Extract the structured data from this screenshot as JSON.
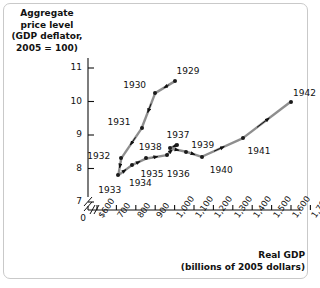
{
  "chart_data": {
    "type": "line",
    "title": "",
    "ylabel": "Aggregate\nprice level\n(GDP deflator,\n2005 = 100)",
    "ylabel_lines": [
      "Aggregate",
      "price level",
      "(GDP deflator,",
      "2005 = 100)"
    ],
    "xlabel_lines": [
      "Real GDP",
      "(billions of 2005 dollars)"
    ],
    "xlabel": "Real GDP (billions of 2005 dollars)",
    "yticks": [
      11,
      10,
      9,
      8,
      7
    ],
    "ytick_labels": [
      "11",
      "10",
      "9",
      "8",
      "7"
    ],
    "ylim": [
      7,
      11.4
    ],
    "y_axis_break": true,
    "xticks": [
      600,
      700,
      800,
      900,
      1000,
      1100,
      1200,
      1300,
      1400,
      1500,
      1600,
      1700,
      1800
    ],
    "xtick_labels": [
      "$600",
      "700",
      "800",
      "900",
      "1,000",
      "1,100",
      "1,200",
      "1,300",
      "1,400",
      "1,500",
      "1,600",
      "1,700",
      "1,800"
    ],
    "x_origin_label": "0",
    "xlim": [
      600,
      1800
    ],
    "x_axis_break": true,
    "grid": false,
    "legend": null,
    "series": [
      {
        "name": "U.S. economy 1929-1942",
        "points": [
          {
            "label": "1929",
            "x": 1000,
            "y": 10.6
          },
          {
            "label": "1930",
            "x": 900,
            "y": 10.25
          },
          {
            "label": "1931",
            "x": 830,
            "y": 9.2
          },
          {
            "label": "1932",
            "x": 725,
            "y": 8.3
          },
          {
            "label": "1933",
            "x": 710,
            "y": 7.8
          },
          {
            "label": "1934",
            "x": 780,
            "y": 8.1
          },
          {
            "label": "1935",
            "x": 855,
            "y": 8.3
          },
          {
            "label": "1936",
            "x": 960,
            "y": 8.4
          },
          {
            "label": "1937",
            "x": 1010,
            "y": 8.7
          },
          {
            "label": "1938",
            "x": 975,
            "y": 8.6
          },
          {
            "label": "1939",
            "x": 1060,
            "y": 8.5
          },
          {
            "label": "1940",
            "x": 1140,
            "y": 8.35
          },
          {
            "label": "1941",
            "x": 1350,
            "y": 8.9
          },
          {
            "label": "1942",
            "x": 1600,
            "y": 10.0
          }
        ]
      }
    ],
    "label_offsets": [
      {
        "label": "1929",
        "dx": 2,
        "dy": -15
      },
      {
        "label": "1930",
        "dx": -32,
        "dy": -13
      },
      {
        "label": "1931",
        "dx": -34,
        "dy": -11
      },
      {
        "label": "1932",
        "dx": -34,
        "dy": -7
      },
      {
        "label": "1933",
        "dx": -20,
        "dy": 10
      },
      {
        "label": "1934",
        "dx": -3,
        "dy": 13
      },
      {
        "label": "1935",
        "dx": -6,
        "dy": 11
      },
      {
        "label": "1936",
        "dx": 0,
        "dy": 14
      },
      {
        "label": "1937",
        "dx": -10,
        "dy": -15
      },
      {
        "label": "1938",
        "dx": -31,
        "dy": -6
      },
      {
        "label": "1939",
        "dx": 5,
        "dy": -12
      },
      {
        "label": "1940",
        "dx": 8,
        "dy": 8
      },
      {
        "label": "1941",
        "dx": 5,
        "dy": 8
      },
      {
        "label": "1942",
        "dx": 2,
        "dy": -14
      }
    ]
  }
}
